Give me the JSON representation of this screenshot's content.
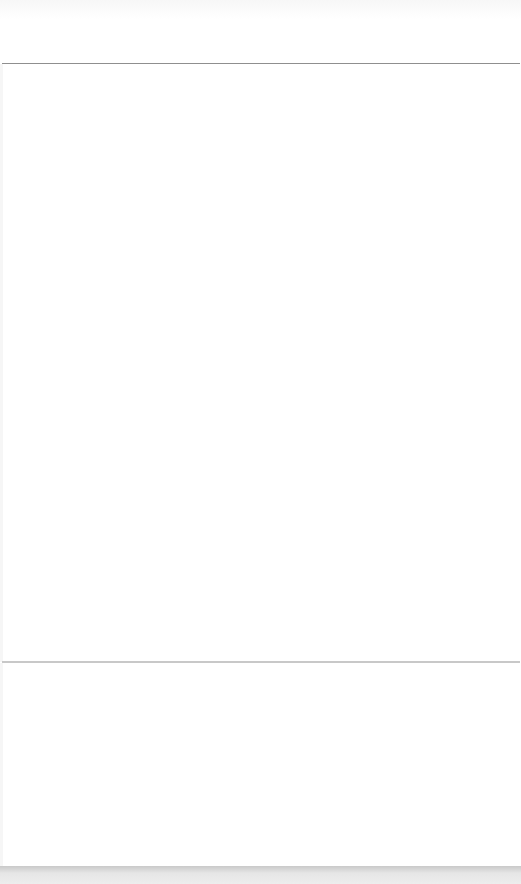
{
  "page": {
    "header": {
      "title": ""
    },
    "content": {
      "text": ""
    },
    "footer": {
      "text": ""
    }
  },
  "colors": {
    "background": "#ffffff",
    "divider_top": "#8f8f8f",
    "divider_mid": "#c8c8c8",
    "bottom_bar": "#d4d4d4"
  }
}
